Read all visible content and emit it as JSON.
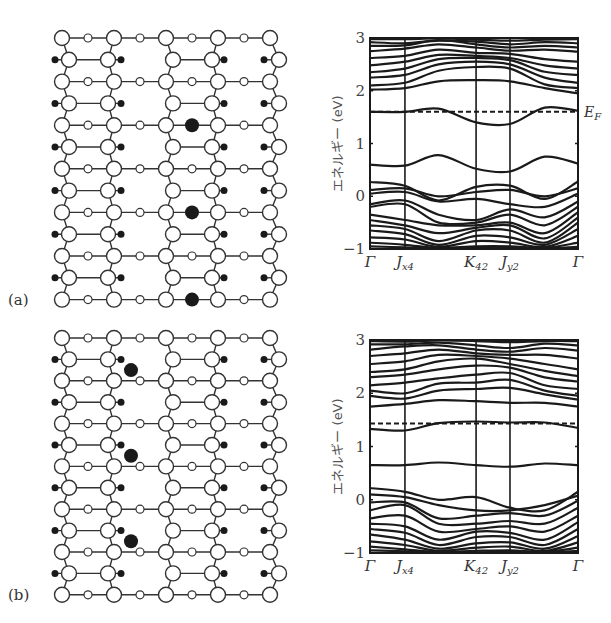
{
  "figure": {
    "panels": [
      {
        "id": "a",
        "label": "(a)",
        "dopant_count": 3,
        "dopant_site": "small-circle bridge site in column between 3rd and 4th large-circle columns"
      },
      {
        "id": "b",
        "label": "(b)",
        "dopant_count": 3,
        "dopant_site": "hollow site between 2nd large-circle column and 2nd small-circle column"
      }
    ],
    "lattice": {
      "rows": 13,
      "large_columns": 5,
      "small_columns": 4,
      "legend": {
        "large_open_circle": "host atom (large)",
        "small_open_circle": "host atom (small)",
        "small_filled_dot": "adsorbed atom",
        "large_filled_dot": "dopant atom"
      },
      "dopants_a": [
        {
          "row": 4,
          "between_cols": [
            2,
            3
          ]
        },
        {
          "row": 8,
          "between_cols": [
            2,
            3
          ]
        },
        {
          "row": 12,
          "between_cols": [
            2,
            3
          ]
        }
      ],
      "dopants_b": [
        {
          "between_rows": [
            1,
            2
          ],
          "near_col": 1
        },
        {
          "between_rows": [
            5,
            6
          ],
          "near_col": 1
        },
        {
          "between_rows": [
            9,
            10
          ],
          "near_col": 1
        }
      ]
    }
  },
  "chart_data": [
    {
      "type": "line",
      "panel": "(a)",
      "title": "",
      "xlabel": "",
      "ylabel": "エネルギー (eV)",
      "ylim": [
        -1,
        3
      ],
      "yticks": [
        -1,
        0,
        1,
        2,
        3
      ],
      "ytick_labels": [
        "−1",
        "0",
        "1",
        "2",
        "3"
      ],
      "xticks": [
        {
          "label": "Γ",
          "sub": "",
          "k": 0
        },
        {
          "label": "J",
          "sub": "x4",
          "k": 0.168
        },
        {
          "label": "K",
          "sub": "42",
          "k": 0.51
        },
        {
          "label": "J",
          "sub": "y2",
          "k": 0.673
        },
        {
          "label": "Γ",
          "sub": "",
          "k": 1
        }
      ],
      "fermi_level": {
        "label": "E",
        "sub": "F",
        "value": 1.6
      },
      "k_nodes": [
        0,
        0.168,
        0.33,
        0.51,
        0.673,
        0.84,
        1
      ],
      "series": [
        {
          "name": "band-f1",
          "values": [
            2.98,
            2.98,
            2.99,
            2.97,
            2.95,
            2.97,
            2.98
          ]
        },
        {
          "name": "band-f2",
          "values": [
            2.92,
            2.9,
            2.95,
            2.93,
            2.88,
            2.92,
            2.9
          ]
        },
        {
          "name": "band-f3",
          "values": [
            2.85,
            2.86,
            2.96,
            2.88,
            2.82,
            2.85,
            2.82
          ]
        },
        {
          "name": "band-f4",
          "values": [
            2.75,
            2.8,
            2.88,
            2.82,
            2.76,
            2.78,
            2.74
          ]
        },
        {
          "name": "band-f5",
          "values": [
            2.62,
            2.66,
            2.78,
            2.72,
            2.7,
            2.6,
            2.55
          ]
        },
        {
          "name": "band-f6",
          "values": [
            2.48,
            2.55,
            2.68,
            2.66,
            2.62,
            2.48,
            2.42
          ]
        },
        {
          "name": "band-f7",
          "values": [
            2.35,
            2.42,
            2.6,
            2.62,
            2.58,
            2.36,
            2.3
          ]
        },
        {
          "name": "band-f8",
          "values": [
            2.25,
            2.3,
            2.5,
            2.55,
            2.5,
            2.25,
            2.15
          ]
        },
        {
          "name": "band-f9",
          "values": [
            2.1,
            2.15,
            2.38,
            2.45,
            2.42,
            2.12,
            2.05
          ]
        },
        {
          "name": "band-f10",
          "values": [
            2.02,
            2.05,
            2.18,
            2.2,
            2.18,
            2.05,
            1.95
          ]
        },
        {
          "name": "band-c1",
          "values": [
            1.6,
            1.6,
            1.66,
            1.4,
            1.37,
            1.68,
            1.62
          ]
        },
        {
          "name": "band-m1",
          "values": [
            0.6,
            0.58,
            0.78,
            0.52,
            0.47,
            0.75,
            0.62
          ]
        },
        {
          "name": "band-v1",
          "values": [
            0.27,
            0.2,
            -0.08,
            0.18,
            0.2,
            -0.05,
            0.28
          ]
        },
        {
          "name": "band-v2",
          "values": [
            0.12,
            0.15,
            0.0,
            0.08,
            0.12,
            0.0,
            0.15
          ]
        },
        {
          "name": "band-v3",
          "values": [
            0.05,
            0.08,
            -0.1,
            -0.05,
            -0.15,
            -0.2,
            0.05
          ]
        },
        {
          "name": "band-v4",
          "values": [
            -0.15,
            -0.08,
            -0.35,
            -0.45,
            -0.25,
            -0.4,
            -0.1
          ]
        },
        {
          "name": "band-v5",
          "values": [
            -0.2,
            -0.15,
            -0.5,
            -0.5,
            -0.35,
            -0.55,
            -0.2
          ]
        },
        {
          "name": "band-v6",
          "values": [
            -0.35,
            -0.45,
            -0.55,
            -0.55,
            -0.5,
            -0.7,
            -0.3
          ]
        },
        {
          "name": "band-v7",
          "values": [
            -0.45,
            -0.55,
            -0.7,
            -0.6,
            -0.55,
            -0.8,
            -0.4
          ]
        },
        {
          "name": "band-v8",
          "values": [
            -0.55,
            -0.62,
            -0.85,
            -0.65,
            -0.65,
            -0.88,
            -0.5
          ]
        },
        {
          "name": "band-v9",
          "values": [
            -0.65,
            -0.72,
            -0.92,
            -0.75,
            -0.78,
            -0.92,
            -0.62
          ]
        },
        {
          "name": "band-v10",
          "values": [
            -0.78,
            -0.82,
            -0.96,
            -0.85,
            -0.88,
            -0.96,
            -0.75
          ]
        },
        {
          "name": "band-v11",
          "values": [
            -0.88,
            -0.92,
            -0.98,
            -0.95,
            -0.95,
            -0.98,
            -0.88
          ]
        },
        {
          "name": "band-v12",
          "values": [
            -0.95,
            -0.97,
            -0.99,
            -0.98,
            -0.98,
            -0.99,
            -0.96
          ]
        }
      ]
    },
    {
      "type": "line",
      "panel": "(b)",
      "title": "",
      "xlabel": "",
      "ylabel": "エネルギー (eV)",
      "ylim": [
        -1,
        3
      ],
      "yticks": [
        -1,
        0,
        1,
        2,
        3
      ],
      "ytick_labels": [
        "−1",
        "0",
        "1",
        "2",
        "3"
      ],
      "xticks": [
        {
          "label": "Γ",
          "sub": "",
          "k": 0
        },
        {
          "label": "J",
          "sub": "x4",
          "k": 0.168
        },
        {
          "label": "K",
          "sub": "42",
          "k": 0.51
        },
        {
          "label": "J",
          "sub": "y2",
          "k": 0.673
        },
        {
          "label": "Γ",
          "sub": "",
          "k": 1
        }
      ],
      "fermi_level": {
        "label": "",
        "sub": "",
        "value": 1.43
      },
      "k_nodes": [
        0,
        0.168,
        0.33,
        0.51,
        0.673,
        0.84,
        1
      ],
      "series": [
        {
          "name": "band-f1",
          "values": [
            2.98,
            2.97,
            2.99,
            2.98,
            2.96,
            2.98,
            2.98
          ]
        },
        {
          "name": "band-f2",
          "values": [
            2.92,
            2.92,
            2.95,
            2.9,
            2.85,
            2.93,
            2.9
          ]
        },
        {
          "name": "band-f3",
          "values": [
            2.82,
            2.88,
            2.9,
            2.82,
            2.78,
            2.85,
            2.8
          ]
        },
        {
          "name": "band-f4",
          "values": [
            2.7,
            2.75,
            2.82,
            2.75,
            2.72,
            2.72,
            2.65
          ]
        },
        {
          "name": "band-f5",
          "values": [
            2.55,
            2.6,
            2.72,
            2.7,
            2.65,
            2.55,
            2.45
          ]
        },
        {
          "name": "band-f6",
          "values": [
            2.4,
            2.45,
            2.6,
            2.65,
            2.55,
            2.42,
            2.32
          ]
        },
        {
          "name": "band-f7",
          "values": [
            2.3,
            2.35,
            2.45,
            2.52,
            2.48,
            2.3,
            2.22
          ]
        },
        {
          "name": "band-f8",
          "values": [
            2.15,
            2.2,
            2.28,
            2.35,
            2.38,
            2.15,
            2.08
          ]
        },
        {
          "name": "band-f9",
          "values": [
            2.05,
            2.0,
            2.18,
            2.2,
            2.25,
            2.05,
            1.95
          ]
        },
        {
          "name": "band-f10",
          "values": [
            1.95,
            1.9,
            2.05,
            2.08,
            2.1,
            1.98,
            1.88
          ]
        },
        {
          "name": "band-c0",
          "values": [
            1.75,
            1.8,
            1.87,
            1.85,
            1.82,
            1.82,
            1.75
          ]
        },
        {
          "name": "band-c1",
          "values": [
            1.33,
            1.3,
            1.44,
            1.47,
            1.45,
            1.45,
            1.35
          ]
        },
        {
          "name": "band-m1",
          "values": [
            0.65,
            0.65,
            0.7,
            0.65,
            0.62,
            0.68,
            0.65
          ]
        },
        {
          "name": "band-v1",
          "values": [
            0.22,
            0.15,
            0.0,
            0.05,
            -0.15,
            -0.2,
            0.15
          ]
        },
        {
          "name": "band-v2",
          "values": [
            0.1,
            0.05,
            -0.1,
            -0.2,
            -0.2,
            -0.1,
            0.08
          ]
        },
        {
          "name": "band-v3",
          "values": [
            -0.05,
            -0.05,
            -0.35,
            -0.3,
            -0.25,
            -0.3,
            -0.02
          ]
        },
        {
          "name": "band-v4",
          "values": [
            -0.2,
            -0.1,
            -0.45,
            -0.45,
            -0.4,
            -0.45,
            -0.15
          ]
        },
        {
          "name": "band-v5",
          "values": [
            -0.35,
            -0.3,
            -0.6,
            -0.55,
            -0.5,
            -0.6,
            -0.3
          ]
        },
        {
          "name": "band-v6",
          "values": [
            -0.45,
            -0.5,
            -0.75,
            -0.6,
            -0.62,
            -0.75,
            -0.42
          ]
        },
        {
          "name": "band-v7",
          "values": [
            -0.55,
            -0.62,
            -0.85,
            -0.7,
            -0.7,
            -0.85,
            -0.55
          ]
        },
        {
          "name": "band-v8",
          "values": [
            -0.65,
            -0.75,
            -0.92,
            -0.82,
            -0.8,
            -0.92,
            -0.68
          ]
        },
        {
          "name": "band-v9",
          "values": [
            -0.78,
            -0.85,
            -0.96,
            -0.9,
            -0.88,
            -0.96,
            -0.8
          ]
        },
        {
          "name": "band-v10",
          "values": [
            -0.88,
            -0.93,
            -0.98,
            -0.96,
            -0.95,
            -0.98,
            -0.9
          ]
        },
        {
          "name": "band-v11",
          "values": [
            -0.95,
            -0.97,
            -0.99,
            -0.99,
            -0.98,
            -0.99,
            -0.96
          ]
        }
      ]
    }
  ]
}
